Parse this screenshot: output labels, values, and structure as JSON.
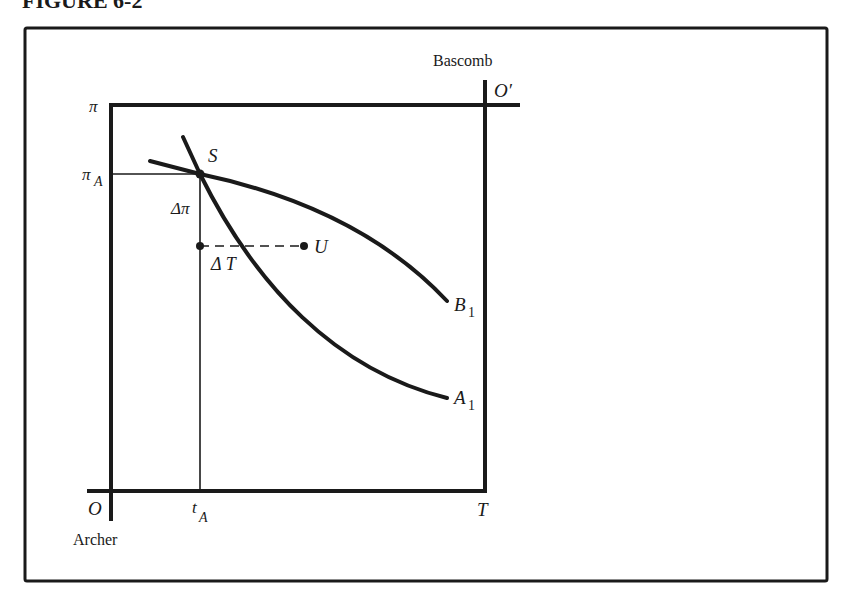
{
  "figure": {
    "title": "FIGURE 6-2",
    "frame": {
      "x": 25,
      "y": 28,
      "width": 802,
      "height": 553
    }
  },
  "axes": {
    "archer_origin_label": "O",
    "archer_name": "Archer",
    "bascomb_origin_label": "O′",
    "bascomb_name": "Bascomb",
    "y_axis_label": "π",
    "x_axis_end_label": "T"
  },
  "points": {
    "S": {
      "label": "S",
      "x": 200,
      "y": 174
    },
    "U": {
      "label": "U",
      "x": 304,
      "y": 246
    },
    "pi_A": {
      "label": "π",
      "subscript": "A"
    },
    "t_A": {
      "label": "t",
      "subscript": "A"
    }
  },
  "annotations": {
    "delta_pi": "Δπ",
    "delta_T": "Δ T"
  },
  "curves": {
    "A1": {
      "label": "A",
      "subscript": "1"
    },
    "B1": {
      "label": "B",
      "subscript": "1"
    }
  },
  "colors": {
    "ink": "#1a1a1a",
    "background": "#ffffff"
  }
}
